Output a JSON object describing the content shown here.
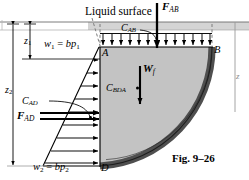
{
  "figure": {
    "caption": "Fig. 9–26",
    "title_text": "Liquid surface",
    "labels": {
      "liquid_surface": "Liquid surface",
      "force_ab": "F",
      "force_ab_sub": "AB",
      "force_ad": "F",
      "force_ad_sub": "AD",
      "weight": "W",
      "weight_sub": "f",
      "centroid_ab": "C",
      "centroid_ab_sub": "AB",
      "centroid_ad": "C",
      "centroid_ad_sub": "AD",
      "centroid_bda": "C",
      "centroid_bda_sub": "BDA",
      "point_a": "A",
      "point_b": "B",
      "point_d": "D",
      "dim_z1": "z",
      "dim_z1_sub": "1",
      "dim_z2": "z",
      "dim_z2_sub": "2",
      "w1_expr_w": "w",
      "w1_expr_sub": "1",
      "w1_expr_eq": " = ",
      "w1_expr_b": "b",
      "w1_expr_p": "p",
      "w1_expr_psub": "1",
      "w2_expr_w": "w",
      "w2_expr_sub": "2",
      "w2_expr_eq": " = ",
      "w2_expr_b": "b",
      "w2_expr_p": "p",
      "w2_expr_psub": "2",
      "edge_partial": "z"
    },
    "colors": {
      "ink": "#000000",
      "fluid_fill": "#c3c3c3",
      "surface_band": "#d2d2d2",
      "gate_arc": "#575757",
      "dashed": "#8a8a8a",
      "paper": "#ffffff"
    },
    "geometry": {
      "surface_y": 28,
      "top_line_y": 47,
      "point_a_x": 100,
      "point_b_x": 212,
      "point_d_y": 166,
      "arrow_count_top": 13,
      "arrow_count_left": 9
    }
  }
}
